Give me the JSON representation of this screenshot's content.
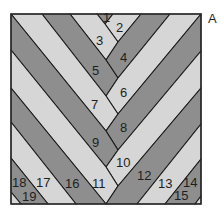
{
  "diagram": {
    "title_label": "A",
    "colors": {
      "dark": "#8e8e8e",
      "light": "#d6d6d6",
      "line": "#1a1a1a"
    },
    "pieces": [
      {
        "id": "1",
        "tone": "dark",
        "points": "97,14 113,14 105,24",
        "label_x": 103,
        "label_y": 22
      },
      {
        "id": "2",
        "tone": "light",
        "points": "113,14 141,14 118,42 105,24",
        "label_x": 116,
        "label_y": 32
      },
      {
        "id": "3",
        "tone": "light",
        "points": "70,14 97,14 105,24 118,42 106,60",
        "label_x": 96,
        "label_y": 45
      },
      {
        "id": "4",
        "tone": "dark",
        "points": "141,14 170,14 118,78 106,60 118,42",
        "label_x": 120,
        "label_y": 62
      },
      {
        "id": "5",
        "tone": "dark",
        "points": "42,14 70,14 106,60 118,78 106,96",
        "label_x": 92,
        "label_y": 75
      },
      {
        "id": "6",
        "tone": "light",
        "points": "170,14 201,14 118,114 106,96 118,78",
        "label_x": 120,
        "label_y": 97
      },
      {
        "id": "7",
        "tone": "light",
        "points": "11,14 42,14 106,96 118,114 106,131",
        "label_x": 91,
        "label_y": 109
      },
      {
        "id": "8",
        "tone": "dark",
        "points": "201,14 201,51 118,150 106,131 118,114",
        "label_x": 120,
        "label_y": 132
      },
      {
        "id": "9",
        "tone": "dark",
        "points": "11,14 106,131 118,150 106,167 11,50",
        "label_x": 92,
        "label_y": 147
      },
      {
        "id": "10",
        "tone": "light",
        "points": "201,51 201,88 118,186 106,167 118,150",
        "label_x": 116,
        "label_y": 167
      },
      {
        "id": "11",
        "tone": "light",
        "points": "11,50 106,167 118,186 106,204 11,88",
        "label_x": 92,
        "label_y": 188
      },
      {
        "id": "12",
        "tone": "dark",
        "points": "201,88 201,124 137,204 106,204 118,186",
        "label_x": 137,
        "label_y": 180
      },
      {
        "id": "13",
        "tone": "light",
        "points": "201,124 201,159 165,204 137,204",
        "label_x": 158,
        "label_y": 188
      },
      {
        "id": "14",
        "tone": "dark",
        "points": "201,159 201,196 195,204 165,204",
        "label_x": 183,
        "label_y": 187
      },
      {
        "id": "15",
        "tone": "light",
        "points": "201,196 201,204 195,204",
        "label_x": 174,
        "label_y": 200
      },
      {
        "id": "16",
        "tone": "dark",
        "points": "11,88 106,204 76,204 11,122",
        "label_x": 65,
        "label_y": 188
      },
      {
        "id": "17",
        "tone": "light",
        "points": "11,122 76,204 48,204 11,158",
        "label_x": 36,
        "label_y": 187
      },
      {
        "id": "18",
        "tone": "dark",
        "points": "11,158 48,204 21,204 11,192",
        "label_x": 12,
        "label_y": 187
      },
      {
        "id": "19",
        "tone": "light",
        "points": "11,192 21,204 11,204",
        "label_x": 22,
        "label_y": 201
      }
    ]
  }
}
